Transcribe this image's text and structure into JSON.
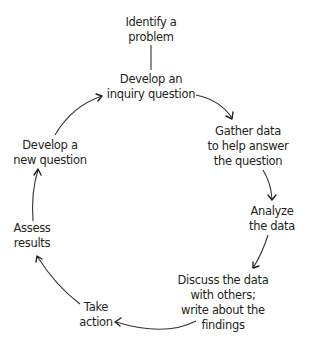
{
  "diagram": {
    "type": "cycle",
    "title": "",
    "colors": {
      "text": "#231f20",
      "arrow": "#333333",
      "background": "#ffffff"
    },
    "nodes": [
      {
        "id": "identify",
        "lines": [
          "Identify a",
          "problem"
        ]
      },
      {
        "id": "develop_inquiry",
        "lines": [
          "Develop an",
          "inquiry question"
        ]
      },
      {
        "id": "gather",
        "lines": [
          "Gather data",
          "to help answer",
          "the question"
        ]
      },
      {
        "id": "analyze",
        "lines": [
          "Analyze",
          "the data"
        ]
      },
      {
        "id": "discuss",
        "lines": [
          "Discuss the data",
          "with others;",
          "write about the",
          "findings"
        ]
      },
      {
        "id": "take_action",
        "lines": [
          "Take",
          "action"
        ]
      },
      {
        "id": "assess",
        "lines": [
          "Assess",
          "results"
        ]
      },
      {
        "id": "develop_new",
        "lines": [
          "Develop a",
          "new question"
        ]
      }
    ],
    "edges": [
      {
        "from": "identify",
        "to": "develop_inquiry",
        "style": "line"
      },
      {
        "from": "develop_inquiry",
        "to": "gather",
        "style": "arrow"
      },
      {
        "from": "gather",
        "to": "analyze",
        "style": "arrow"
      },
      {
        "from": "analyze",
        "to": "discuss",
        "style": "arrow"
      },
      {
        "from": "discuss",
        "to": "take_action",
        "style": "arrow"
      },
      {
        "from": "take_action",
        "to": "assess",
        "style": "arrow"
      },
      {
        "from": "assess",
        "to": "develop_new",
        "style": "arrow"
      },
      {
        "from": "develop_new",
        "to": "develop_inquiry",
        "style": "arrow"
      }
    ]
  }
}
